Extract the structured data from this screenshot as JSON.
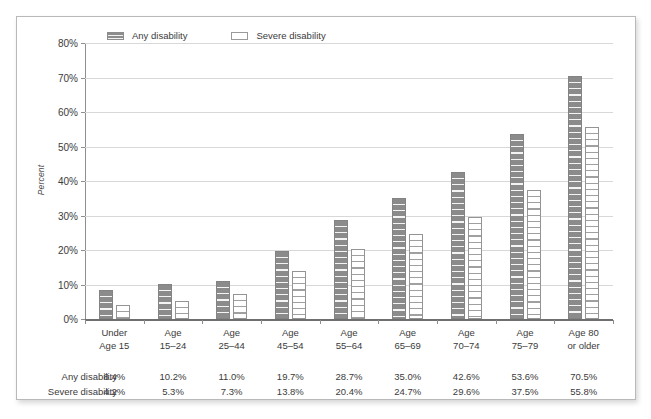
{
  "chart_data": {
    "type": "bar",
    "title": "",
    "subtitle": "",
    "xlabel": "",
    "ylabel": "Percent",
    "ylim": [
      0,
      80
    ],
    "grid": true,
    "legend_position": "top",
    "y_ticks": [
      "0%",
      "10%",
      "20%",
      "30%",
      "40%",
      "50%",
      "60%",
      "70%",
      "80%"
    ],
    "y_tick_values": [
      0,
      10,
      20,
      30,
      40,
      50,
      60,
      70,
      80
    ],
    "categories": [
      [
        "Under",
        "Age 15"
      ],
      [
        "Age",
        "15–24"
      ],
      [
        "Age",
        "25–44"
      ],
      [
        "Age",
        "45–54"
      ],
      [
        "Age",
        "55–64"
      ],
      [
        "Age",
        "65–69"
      ],
      [
        "Age",
        "70–74"
      ],
      [
        "Age",
        "75–79"
      ],
      [
        "Age 80",
        "or older"
      ]
    ],
    "series": [
      {
        "name": "Any disability",
        "values": [
          8.4,
          10.2,
          11.0,
          19.7,
          28.7,
          35.0,
          42.6,
          53.6,
          70.5
        ],
        "labels": [
          "8.4%",
          "10.2%",
          "11.0%",
          "19.7%",
          "28.7%",
          "35.0%",
          "42.6%",
          "53.6%",
          "70.5%"
        ],
        "color": "#8b8b8b",
        "pattern": "horizontal-stripe-filled"
      },
      {
        "name": "Severe disability",
        "values": [
          4.2,
          5.3,
          7.3,
          13.8,
          20.4,
          24.7,
          29.6,
          37.5,
          55.8
        ],
        "labels": [
          "4.2%",
          "5.3%",
          "7.3%",
          "13.8%",
          "20.4%",
          "24.7%",
          "29.6%",
          "37.5%",
          "55.8%"
        ],
        "color": "#ffffff",
        "pattern": "horizontal-stripe-outline"
      }
    ]
  },
  "legend": {
    "items": [
      {
        "label": "Any disability",
        "swatch": "filled-striped-swatch"
      },
      {
        "label": "Severe disability",
        "swatch": "outline-swatch"
      }
    ]
  },
  "data_table": {
    "rows": [
      {
        "header": "Any disability",
        "cells": [
          "8.4%",
          "10.2%",
          "11.0%",
          "19.7%",
          "28.7%",
          "35.0%",
          "42.6%",
          "53.6%",
          "70.5%"
        ]
      },
      {
        "header": "Severe disability",
        "cells": [
          "4.2%",
          "5.3%",
          "7.3%",
          "13.8%",
          "20.4%",
          "24.7%",
          "29.6%",
          "37.5%",
          "55.8%"
        ]
      }
    ]
  },
  "colors": {
    "any_disability": "#8b8b8b",
    "severe_disability": "#ffffff",
    "gridline": "#d8d8d8",
    "axis": "#8e8e8e",
    "text": "#3b3b3b",
    "frame_border": "#b9b9b9"
  }
}
